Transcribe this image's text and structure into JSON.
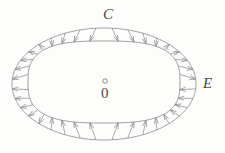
{
  "figure": {
    "background_color": "#fdfdfc",
    "stroke_color": "#8d8d8d",
    "label_color": "#4a4a4a",
    "labels": {
      "outer_curve": "E",
      "inner_curve": "C",
      "origin": "0",
      "origin_marker": "circle-marker"
    }
  },
  "chart_data": {
    "type": "diagram",
    "xlabel": "",
    "ylabel": "",
    "grid": false,
    "legend": false,
    "center": {
      "x": 104,
      "y": 83
    },
    "curves": [
      {
        "name": "E",
        "kind": "ellipse",
        "label": "E",
        "label_position": "right-vertex",
        "cx": 104,
        "cy": 84,
        "rx": 92,
        "ry": 56,
        "vertices": {
          "left_x": 12,
          "right_x": 196,
          "top_y": 28,
          "bottom_y": 140
        }
      },
      {
        "name": "C",
        "kind": "squircle",
        "label": "C",
        "label_position": "top",
        "cx": 104,
        "cy": 82,
        "rx": 76,
        "ry": 41,
        "exponent": 2.9,
        "extents": {
          "left_x": 28,
          "right_x": 180,
          "top_y": 41,
          "bottom_y": 123
        }
      }
    ],
    "origin_marker": {
      "x": 105,
      "y": 81,
      "r": 2.2,
      "label": "0",
      "label_x": 105,
      "label_y": 94
    },
    "vectors": {
      "description": "Radial segments joining curve C to ellipse E; arrowheads point outward near the major axis (left and right) and inward near the minor axis (top and bottom).",
      "count": 36,
      "outward_sectors_deg": [
        [
          -52,
          52
        ],
        [
          128,
          232
        ]
      ],
      "inward_sectors_deg": [
        [
          58,
          122
        ],
        [
          238,
          302
        ]
      ]
    }
  }
}
